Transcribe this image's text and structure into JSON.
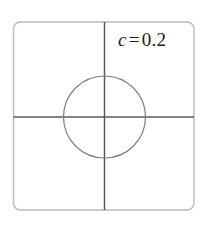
{
  "figure": {
    "name": "unit-cell-diagram",
    "background_color": "#ffffff",
    "frame": {
      "name": "plot-frame",
      "shape": "rounded-square",
      "x": 13.5,
      "y": 22.0,
      "width": 180.5,
      "height": 188.0,
      "corner_radius": 7,
      "stroke_color": "#b9b9b9",
      "stroke_width": 1.4,
      "fill": "#ffffff"
    },
    "axes": {
      "name": "crosshair-axes",
      "stroke_color": "#5a5a5a",
      "stroke_width": 1.5,
      "vertical": {
        "x": 104.5,
        "y1": 22.0,
        "y2": 210.0
      },
      "horizontal": {
        "y": 117.0,
        "x1": 13.5,
        "x2": 194.0
      }
    },
    "circle": {
      "name": "inclusion-circle",
      "center_x": 104.5,
      "center_y": 117.0,
      "radius": 41.0,
      "stroke_color": "#7d7d7d",
      "stroke_width": 1.2,
      "fill": "none"
    },
    "label": {
      "name": "volume-fraction-label",
      "variable": "c",
      "operator": "=",
      "value": "0.2",
      "text": "c = 0.2",
      "x": 118,
      "y": 38,
      "color": "#1a1a1a",
      "font_size_px": 19
    }
  },
  "chart_data": {
    "type": "diagram",
    "title": "",
    "annotations": [
      {
        "label": "c = 0.2",
        "variable": "c",
        "value": 0.2,
        "meaning": "volume fraction of circular inclusion"
      }
    ],
    "geometry": {
      "cell_shape": "square",
      "cell_side_px": 180.5,
      "inclusion_shape": "circle",
      "inclusion_radius_px": 41.0,
      "inclusion_center": [
        104.5,
        117.0
      ],
      "area_fraction": 0.2,
      "axes": [
        "vertical-symmetry-axis",
        "horizontal-symmetry-axis"
      ]
    },
    "xlabel": "",
    "ylabel": "",
    "legend": []
  }
}
